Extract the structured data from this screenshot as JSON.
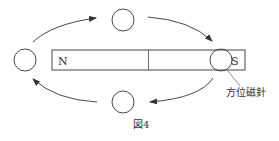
{
  "figure": {
    "caption": "図4",
    "magnet": {
      "north_label": "N",
      "south_label": "S"
    },
    "compass_label": "方位磁針",
    "compasses": [
      {
        "position": "left"
      },
      {
        "position": "top"
      },
      {
        "position": "right"
      },
      {
        "position": "bottom"
      }
    ],
    "arrows_direction": "clockwise from N around to S and back",
    "colors": {
      "stroke": "#333333",
      "background": "#ffffff"
    }
  }
}
